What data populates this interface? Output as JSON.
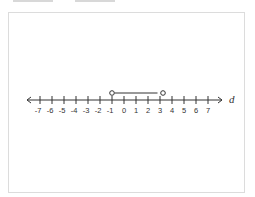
{
  "top_tabs": [
    {
      "name": "tab-1"
    },
    {
      "name": "tab-2"
    }
  ],
  "number_line": {
    "variable": "d",
    "min": -7,
    "max": 7,
    "tick_labels": [
      "-7",
      "-6",
      "-5",
      "-4",
      "-3",
      "-2",
      "-1",
      "0",
      "1",
      "2",
      "3",
      "4",
      "5",
      "6",
      "7"
    ],
    "segment": {
      "start": -1,
      "end": 3,
      "start_closed": false,
      "end_closed": false
    },
    "colors": {
      "line": "#333333",
      "segment": "#333333"
    }
  }
}
